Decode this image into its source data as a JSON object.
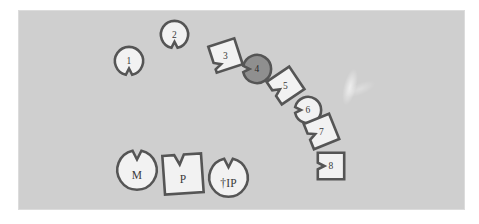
{
  "figure": {
    "width": 479,
    "height": 224,
    "background_color": "#ffffff"
  },
  "panel": {
    "x": 18,
    "y": 10,
    "width": 447,
    "height": 200,
    "fill_color": "#cfcfcf",
    "border_color": "#e8e8e8"
  },
  "style": {
    "shape_fill": "#f2f2f2",
    "shape_fill_highlighted": "#8f8f8f",
    "shape_stroke": "#555555",
    "label_color": "#3a3a3a"
  },
  "shapes": [
    {
      "id": "shape-1",
      "label": "1",
      "form": "circle",
      "notch": "bottom",
      "highlighted": false,
      "x": 114,
      "y": 46,
      "size": 30,
      "rotation": 0
    },
    {
      "id": "shape-2",
      "label": "2",
      "form": "circle",
      "notch": "bottom",
      "highlighted": false,
      "x": 160,
      "y": 20,
      "size": 29,
      "rotation": 0
    },
    {
      "id": "shape-3",
      "label": "3",
      "form": "square",
      "notch": "bottom-left",
      "highlighted": false,
      "x": 210,
      "y": 40,
      "size": 31,
      "rotation": -18
    },
    {
      "id": "shape-4",
      "label": "4",
      "form": "circle",
      "notch": "left",
      "highlighted": true,
      "x": 242,
      "y": 54,
      "size": 30,
      "rotation": 0
    },
    {
      "id": "shape-5",
      "label": "5",
      "form": "square",
      "notch": "left",
      "highlighted": false,
      "x": 270,
      "y": 70,
      "size": 31,
      "rotation": -34
    },
    {
      "id": "shape-6",
      "label": "6",
      "form": "circle",
      "notch": "left",
      "highlighted": false,
      "x": 294,
      "y": 96,
      "size": 28,
      "rotation": 0
    },
    {
      "id": "shape-7",
      "label": "7",
      "form": "square",
      "notch": "left",
      "highlighted": false,
      "x": 306,
      "y": 116,
      "size": 31,
      "rotation": -22
    },
    {
      "id": "shape-8",
      "label": "8",
      "form": "square",
      "notch": "left",
      "highlighted": false,
      "x": 316,
      "y": 151,
      "size": 30,
      "rotation": 0
    },
    {
      "id": "shape-m",
      "label": "M",
      "form": "circle",
      "notch": "top",
      "highlighted": false,
      "x": 116,
      "y": 149,
      "size": 42,
      "rotation": 0
    },
    {
      "id": "shape-p",
      "label": "P",
      "form": "square",
      "notch": "top",
      "highlighted": false,
      "x": 161,
      "y": 152,
      "size": 44,
      "rotation": -4
    },
    {
      "id": "shape-ip",
      "label": "†IP",
      "form": "circle",
      "notch": "top",
      "highlighted": false,
      "x": 208,
      "y": 157,
      "size": 41,
      "rotation": 0
    }
  ]
}
